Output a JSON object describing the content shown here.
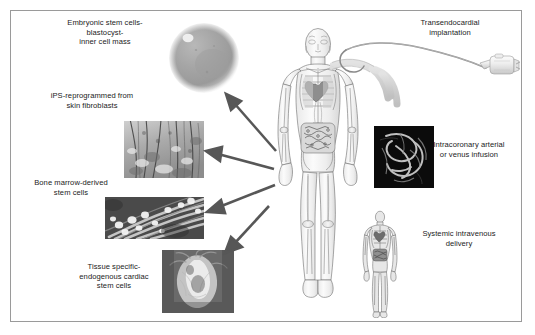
{
  "figure": {
    "background": "#ffffff",
    "border_color": "#9a9a9a",
    "arrow_color": "#555555",
    "text_color": "#1b1b1b"
  },
  "labels": {
    "embryonic": "Embryonic stem cells-\nblastocyst-\ninner cell mass",
    "ips": "iPS-reprogrammed from\nskin fibroblasts",
    "bone_marrow": "Bone marrow-derived\nstem cells",
    "tissue_specific": "Tissue specific-\nendogenous cardiac\nstem cells",
    "transendocardial": "Transendocardial\nimplantation",
    "intracoronary": "Intracoronary arterial\nor venus infusion",
    "systemic": "Systemic intravenous\ndelivery"
  },
  "panels": {
    "blastocyst": "blastocyst-micrograph",
    "fibroblasts": "skin-fibroblast-micrograph",
    "bone_marrow": "bone-marrow-micrograph",
    "cardiac": "cardiac-stem-cell-micrograph",
    "angiogram": "coronary-angiogram-image",
    "body_main": "human-anatomy-figure",
    "body_small": "human-venous-figure",
    "catheter": "transendocardial-catheter"
  },
  "arrows": [
    {
      "name": "arrow-to-blastocyst",
      "from": [
        274,
        152
      ],
      "to": [
        227,
        96
      ]
    },
    {
      "name": "arrow-to-fibroblasts",
      "from": [
        272,
        170
      ],
      "to": [
        207,
        152
      ]
    },
    {
      "name": "arrow-to-bone-marrow",
      "from": [
        273,
        186
      ],
      "to": [
        208,
        212
      ]
    },
    {
      "name": "arrow-to-cardiac",
      "from": [
        268,
        208
      ],
      "to": [
        224,
        254
      ]
    }
  ]
}
